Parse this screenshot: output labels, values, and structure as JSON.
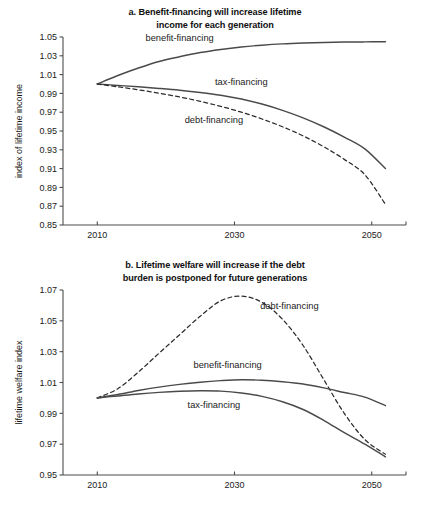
{
  "figure": {
    "panels": [
      {
        "id": "a",
        "title": "a. Benefit-financing will increase lifetime income for each generation",
        "title_line1": "a. Benefit-financing will increase lifetime",
        "title_line2": "income for each generation"
      },
      {
        "id": "b",
        "title": "b. Lifetime welfare will increase if the debt burden is postponed for future generations",
        "title_line1": "b. Lifetime welfare will increase if the debt",
        "title_line2": "burden is postponed for future generations"
      }
    ]
  },
  "chart_data": [
    {
      "type": "line",
      "title": "a. Benefit-financing will increase lifetime income for each generation",
      "xlabel": "",
      "ylabel": "index of lifetime income",
      "xlim": [
        2005,
        2055
      ],
      "ylim": [
        0.85,
        1.05
      ],
      "xticks": [
        2010,
        2030,
        2050
      ],
      "xticklabels": [
        "2010",
        "2030",
        "2050"
      ],
      "yticks": [
        0.85,
        0.87,
        0.89,
        0.91,
        0.93,
        0.95,
        0.97,
        0.99,
        1.01,
        1.03,
        1.05
      ],
      "yticklabels": [
        "0.85",
        "0.87",
        "0.89",
        "0.91",
        "0.93",
        "0.95",
        "0.97",
        "0.99",
        "1.01",
        "1.03",
        "1.05"
      ],
      "grid": false,
      "legend": "inline-annotations",
      "x": [
        2010,
        2013,
        2016,
        2019,
        2022,
        2025,
        2028,
        2031,
        2034,
        2037,
        2040,
        2043,
        2046,
        2049,
        2052
      ],
      "series": [
        {
          "name": "benefit-financing",
          "style": "solid",
          "values": [
            1.0,
            1.009,
            1.017,
            1.024,
            1.029,
            1.0335,
            1.0368,
            1.0394,
            1.0413,
            1.0427,
            1.0436,
            1.0442,
            1.0446,
            1.0448,
            1.0449
          ]
        },
        {
          "name": "tax-financing",
          "style": "solid",
          "values": [
            1.0,
            0.9985,
            0.997,
            0.9953,
            0.9934,
            0.991,
            0.988,
            0.984,
            0.9787,
            0.972,
            0.964,
            0.9545,
            0.9435,
            0.931,
            0.91
          ]
        },
        {
          "name": "debt-financing",
          "style": "dashed",
          "values": [
            1.0,
            0.997,
            0.9938,
            0.9902,
            0.9862,
            0.9816,
            0.9762,
            0.97,
            0.9628,
            0.9545,
            0.9448,
            0.9333,
            0.9198,
            0.9035,
            0.872
          ]
        }
      ],
      "annotations": [
        {
          "text": "benefit-financing",
          "x": 2022,
          "y": 1.046
        },
        {
          "text": "tax-financing",
          "x": 2031,
          "y": 0.999
        },
        {
          "text": "debt-financing",
          "x": 2027,
          "y": 0.958
        }
      ]
    },
    {
      "type": "line",
      "title": "b. Lifetime welfare will increase if the debt burden is postponed for future generations",
      "xlabel": "",
      "ylabel": "lifetime welfare index",
      "xlim": [
        2005,
        2055
      ],
      "ylim": [
        0.95,
        1.07
      ],
      "xticks": [
        2010,
        2030,
        2050
      ],
      "xticklabels": [
        "2010",
        "2030",
        "2050"
      ],
      "yticks": [
        0.95,
        0.97,
        0.99,
        1.01,
        1.03,
        1.05,
        1.07
      ],
      "yticklabels": [
        "0.95",
        "0.97",
        "0.99",
        "1.01",
        "1.03",
        "1.05",
        "1.07"
      ],
      "grid": false,
      "legend": "inline-annotations",
      "x": [
        2010,
        2013,
        2016,
        2019,
        2022,
        2025,
        2028,
        2031,
        2034,
        2037,
        2040,
        2043,
        2046,
        2049,
        2052
      ],
      "series": [
        {
          "name": "debt-financing",
          "style": "dashed",
          "values": [
            1.0,
            1.006,
            1.0168,
            1.029,
            1.041,
            1.053,
            1.063,
            1.066,
            1.062,
            1.051,
            1.034,
            1.012,
            0.99,
            0.973,
            0.9635
          ]
        },
        {
          "name": "benefit-financing",
          "style": "solid",
          "values": [
            1.0,
            1.0022,
            1.0048,
            1.007,
            1.0088,
            1.0102,
            1.0112,
            1.0118,
            1.0115,
            1.0105,
            1.009,
            1.0065,
            1.0035,
            1.0005,
            0.995
          ]
        },
        {
          "name": "tax-financing",
          "style": "solid",
          "values": [
            1.0,
            1.0013,
            1.0026,
            1.0036,
            1.0043,
            1.0046,
            1.0044,
            1.0032,
            1.001,
            0.9975,
            0.9925,
            0.9855,
            0.9775,
            0.97,
            0.9618
          ]
        }
      ],
      "annotations": [
        {
          "text": "debt-financing",
          "x": 2038,
          "y": 1.058
        },
        {
          "text": "benefit-financing",
          "x": 2029,
          "y": 1.0195
        },
        {
          "text": "tax-financing",
          "x": 2027,
          "y": 0.9935
        }
      ]
    }
  ]
}
